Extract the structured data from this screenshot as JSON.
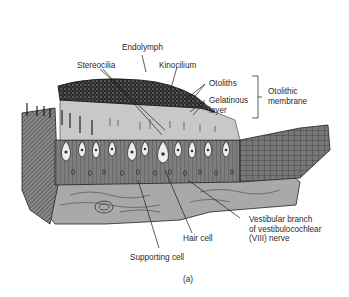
{
  "figure": {
    "panel_label": "(a)",
    "labels": {
      "endolymph": "Endolymph",
      "stereocilia": "Stereocilia",
      "kinocilium": "Kinocilium",
      "otoliths": "Otoliths",
      "gelatinous_layer": "Gelatinous\nlayer",
      "otolithic_membrane": "Otolithic\nmembrane",
      "vestibular_nerve": "Vestibular branch\nof vestibulocochlear\n(VIII) nerve",
      "hair_cell": "Hair cell",
      "supporting_cell": "Supporting cell"
    },
    "colors": {
      "ink": "#1a1a1a",
      "otolith_layer": "#2b2b2b",
      "gelatinous": "#c9c9c9",
      "cell_layer": "#7a7a7a",
      "connective": "#a8a8a8",
      "hair_cell_fill": "#eeeeee"
    }
  }
}
